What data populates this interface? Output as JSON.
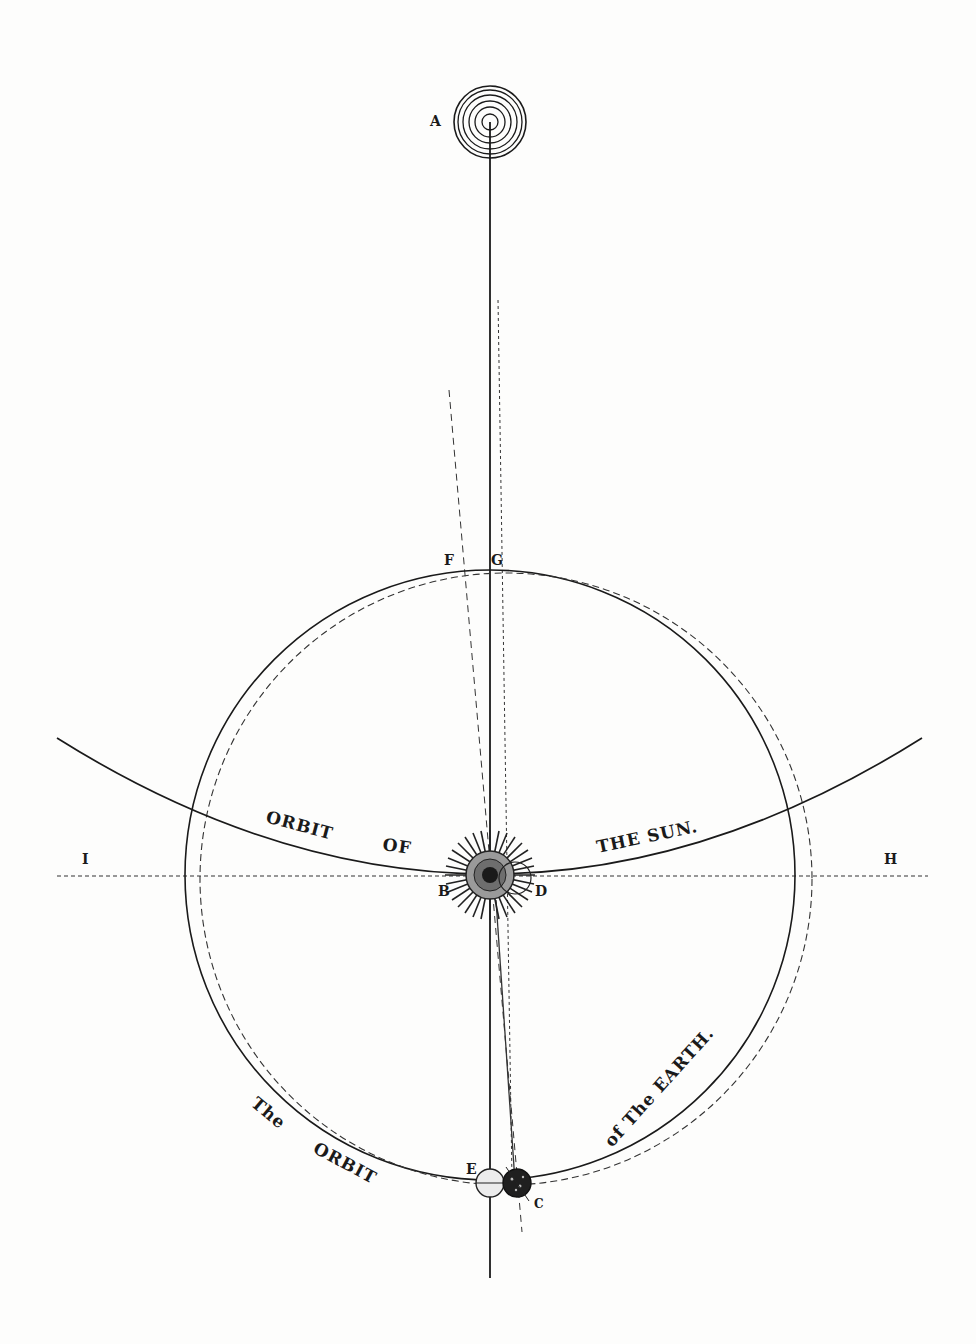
{
  "diagram": {
    "type": "astronomical plate",
    "points": {
      "A": "A",
      "B": "B",
      "C": "C",
      "D": "D",
      "E": "E",
      "F": "F",
      "G": "G",
      "H": "H",
      "I": "I"
    },
    "captions": {
      "sun_orbit_1": "ORBIT",
      "sun_orbit_2": "OF",
      "sun_orbit_3": "THE SUN.",
      "earth_orbit_1": "The",
      "earth_orbit_2": "ORBIT",
      "earth_orbit_3": "of The EARTH."
    },
    "colors": {
      "ink": "#1a1a1a",
      "paper": "#fdfdfc"
    }
  }
}
